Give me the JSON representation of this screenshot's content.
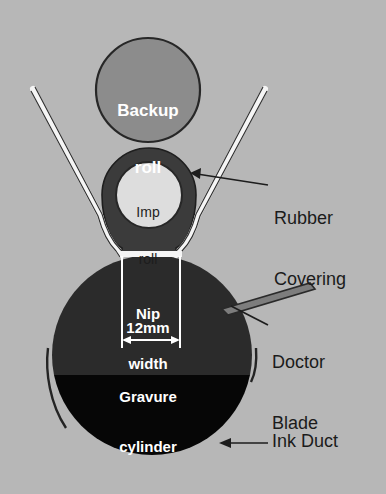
{
  "figure": {
    "type": "technical-cross-section-diagram",
    "background_color": "#b7b7b7"
  },
  "components": {
    "backup_roll": {
      "label": "Backup\nroll",
      "label_line1": "Backup",
      "label_line2": "roll",
      "fill_color": "#8c8c8c",
      "stroke_color": "#2a2a2a",
      "cx": 148,
      "cy": 90,
      "r": 52
    },
    "impression_roll": {
      "label": "Imp\nroll",
      "label_line1": "Imp",
      "label_line2": "roll",
      "core_fill_color": "#dcdcdc",
      "core_stroke_color": "#2a2a2a",
      "cx": 149,
      "cy": 195,
      "r": 33
    },
    "rubber_covering": {
      "label": "Rubber\nCovering",
      "label_line1": "Rubber",
      "label_line2": "Covering",
      "fill_color": "#3b3b3b",
      "thickness_px": 14
    },
    "gravure_cylinder": {
      "label": "Gravure\ncylinder",
      "label_line1": "Gravure",
      "label_line2": "cylinder",
      "fill_color_above_ink": "#2b2b2b",
      "fill_color_below_ink": "#050505",
      "cx": 152,
      "cy": 355,
      "r": 100,
      "ink_level_y": 375
    },
    "doctor_blade": {
      "label": "Doctor\nBlade",
      "label_line1": "Doctor",
      "label_line2": "Blade",
      "fill_color": "#7d7d7d",
      "stroke_color": "#2a2a2a"
    },
    "ink_duct": {
      "label": "Ink Duct",
      "wall_stroke_color": "#2a2a2a"
    },
    "web": {
      "fill_color": "#f4f4f4",
      "stroke_color": "#2a2a2a",
      "description": "paper web"
    }
  },
  "nip": {
    "title": "Nip\nwidth",
    "title_line1": "Nip",
    "title_line2": "width",
    "dimension_value": "12mm",
    "measure_color": "#ffffff",
    "left_x": 122,
    "right_x": 180
  }
}
